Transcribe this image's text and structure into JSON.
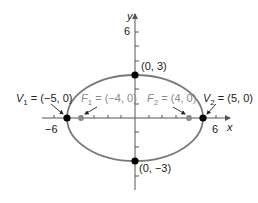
{
  "figure": {
    "type": "ellipse-graph",
    "equation_params": {
      "a": 5,
      "b": 3,
      "c": 4
    },
    "colors": {
      "ellipse": "#7a7a7a",
      "axis": "#555555",
      "vertex_point": "#000000",
      "focus_point": "#8a8a8a",
      "focus_label": "#8a8a8a",
      "text": "#222222"
    },
    "axes": {
      "x_label": "x",
      "y_label": "y",
      "x_tick_labels": {
        "neg": "−6",
        "pos": "6"
      },
      "y_tick_label": "6"
    },
    "points": {
      "v1": {
        "name": "V",
        "sub": "1",
        "eq": " = (−5, 0)"
      },
      "v2": {
        "name": "V",
        "sub": "2",
        "eq": " = (5, 0)"
      },
      "f1": {
        "name": "F",
        "sub": "1",
        "eq": " = (−4, 0)"
      },
      "f2": {
        "name": "F",
        "sub": "2",
        "eq": " = (4, 0)"
      },
      "top": {
        "label": "(0, 3)"
      },
      "bottom": {
        "label": "(0, −3)"
      }
    }
  }
}
